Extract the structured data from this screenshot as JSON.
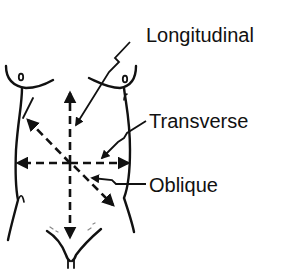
{
  "diagram": {
    "labels": {
      "longitudinal": "Longitudinal",
      "transverse": "Transverse",
      "oblique": "Oblique"
    },
    "colors": {
      "ink": "#111111",
      "background": "#ffffff"
    }
  }
}
